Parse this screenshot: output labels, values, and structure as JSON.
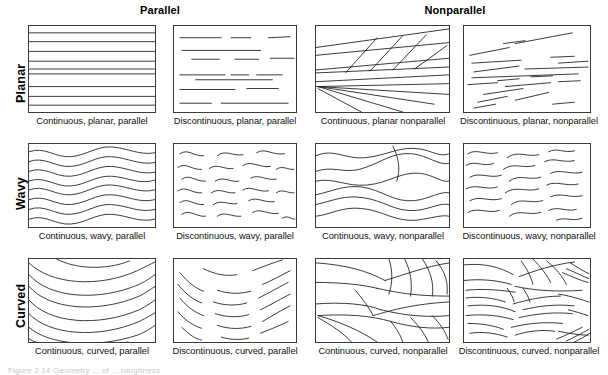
{
  "figure": {
    "caption_partial": "Figure 2.14  Geometry  ...  of ... roughness",
    "column_headers": [
      {
        "label": "Parallel"
      },
      {
        "label": "Nonparallel"
      }
    ],
    "row_labels": [
      {
        "label": "Planar"
      },
      {
        "label": "Wavy"
      },
      {
        "label": "Curved"
      }
    ],
    "panels": [
      {
        "id": "continuous-planar-parallel",
        "caption": "Continuous, planar, parallel"
      },
      {
        "id": "discontinuous-planar-parallel",
        "caption": "Discontinuous, planar, parallel"
      },
      {
        "id": "continuous-planar-nonparallel",
        "caption": "Continuous, planar nonparallel"
      },
      {
        "id": "discontinuous-planar-nonparallel",
        "caption": "Discontinuous, planar, nonparallel"
      },
      {
        "id": "continuous-wavy-parallel",
        "caption": "Continuous, wavy, parallel"
      },
      {
        "id": "discontinuous-wavy-parallel",
        "caption": "Discontinuous, wavy, parallel"
      },
      {
        "id": "continuous-wavy-nonparallel",
        "caption": "Continuous, wavy, nonparallel"
      },
      {
        "id": "discontinuous-wavy-nonparallel",
        "caption": "Discontinuous, wavy, nonparallel"
      },
      {
        "id": "continuous-curved-parallel",
        "caption": "Continuous, curved, parallel"
      },
      {
        "id": "discontinuous-curved-parallel",
        "caption": "Discontinuous, curved, parallel"
      },
      {
        "id": "continuous-curved-nonparallel",
        "caption": "Continuous, curved, nonparallel"
      },
      {
        "id": "discontinuous-curved-nonparallel",
        "caption": "Discontinuous, curved, nonparallel"
      }
    ],
    "colors": {
      "line": "#222222",
      "panel_border": "#3a3a3a",
      "background": "#ffffff",
      "text": "#111111"
    }
  }
}
